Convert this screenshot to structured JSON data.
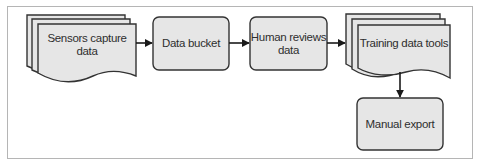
{
  "diagram": {
    "type": "flowchart",
    "colors": {
      "frame": "#b5b5b5",
      "node_fill": "#e6e6e6",
      "node_stroke": "#333333",
      "text": "#2e2e2e",
      "arrow": "#1a1a1a"
    },
    "nodes": [
      {
        "id": "sensors",
        "shape": "multi-document",
        "label": "Sensors capture\ndata"
      },
      {
        "id": "bucket",
        "shape": "rounded-rect",
        "label": "Data bucket"
      },
      {
        "id": "human",
        "shape": "rounded-rect",
        "label": "Human reviews\ndata"
      },
      {
        "id": "tools",
        "shape": "multi-document",
        "label": "Training data tools"
      },
      {
        "id": "export",
        "shape": "rounded-rect",
        "label": "Manual export"
      }
    ],
    "edges": [
      {
        "from": "sensors",
        "to": "bucket"
      },
      {
        "from": "bucket",
        "to": "human"
      },
      {
        "from": "human",
        "to": "tools"
      },
      {
        "from": "tools",
        "to": "export"
      }
    ]
  }
}
